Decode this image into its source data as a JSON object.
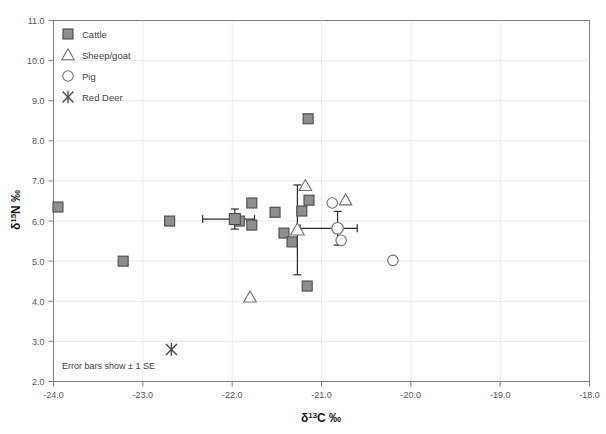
{
  "chart_data": {
    "type": "scatter",
    "title": "",
    "xlabel": "δ 13C ‰",
    "ylabel": "δ 15N ‰",
    "xlim": [
      -24.0,
      -18.0
    ],
    "ylim": [
      2.0,
      11.0
    ],
    "xticks": [
      "-24.0",
      "-23.0",
      "-22.0",
      "-21.0",
      "-20.0",
      "-19.0",
      "-18.0"
    ],
    "yticks": [
      "2.0",
      "3.0",
      "4.0",
      "5.0",
      "6.0",
      "7.0",
      "8.0",
      "9.0",
      "10.0",
      "11.0"
    ],
    "grid": true,
    "legend_position": "top-left",
    "annotation": "Error bars show ± 1 SE",
    "series": [
      {
        "name": "Cattle",
        "marker": "filled-square",
        "color": "#8e8e8e",
        "points": [
          {
            "x": -23.95,
            "y": 6.35
          },
          {
            "x": -23.22,
            "y": 5.0
          },
          {
            "x": -22.7,
            "y": 6.0
          },
          {
            "x": -21.92,
            "y": 6.0
          },
          {
            "x": -21.78,
            "y": 6.45
          },
          {
            "x": -21.78,
            "y": 5.9
          },
          {
            "x": -21.52,
            "y": 6.22
          },
          {
            "x": -21.42,
            "y": 5.7
          },
          {
            "x": -21.33,
            "y": 5.48
          },
          {
            "x": -21.22,
            "y": 6.25
          },
          {
            "x": -21.14,
            "y": 6.52
          },
          {
            "x": -21.15,
            "y": 8.55
          },
          {
            "x": -21.16,
            "y": 4.38
          }
        ]
      },
      {
        "name": "Sheep/goat",
        "marker": "open-triangle",
        "color": "#6e6e6e",
        "points": [
          {
            "x": -21.18,
            "y": 6.88
          },
          {
            "x": -20.73,
            "y": 6.52
          },
          {
            "x": -21.8,
            "y": 4.1
          }
        ]
      },
      {
        "name": "Pig",
        "marker": "open-circle",
        "color": "#6e6e6e",
        "points": [
          {
            "x": -20.88,
            "y": 6.45
          },
          {
            "x": -20.78,
            "y": 5.52
          },
          {
            "x": -20.2,
            "y": 5.02
          }
        ]
      },
      {
        "name": "Red Deer",
        "marker": "x-star",
        "color": "#4a4a4a",
        "points": [
          {
            "x": -22.68,
            "y": 2.8
          }
        ]
      }
    ],
    "means": [
      {
        "name": "Cattle mean",
        "marker": "filled-square",
        "x": -21.97,
        "y": 6.05,
        "xerr_low": 0.36,
        "xerr_high": 0.22,
        "yerr": 0.25
      },
      {
        "name": "Sheep/goat mean",
        "marker": "open-triangle",
        "x": -21.27,
        "y": 5.78,
        "xerr_low": 0.0,
        "xerr_high": 0.0,
        "yerr": 1.12
      },
      {
        "name": "Pig mean",
        "marker": "open-circle",
        "x": -20.82,
        "y": 5.82,
        "xerr_low": 0.42,
        "xerr_high": 0.22,
        "yerr": 0.42
      }
    ]
  },
  "legend": {
    "items": [
      {
        "label": "Cattle",
        "marker": "filled-square"
      },
      {
        "label": "Sheep/goat",
        "marker": "open-triangle"
      },
      {
        "label": "Pig",
        "marker": "open-circle"
      },
      {
        "label": "Red Deer",
        "marker": "x-star"
      }
    ]
  },
  "axis": {
    "x_title_main": "C ‰",
    "x_title_delta": "δ",
    "x_title_sup": "13",
    "y_title_main": "N ‰",
    "y_title_delta": "δ",
    "y_title_sup": "15"
  },
  "ticks": {
    "x": [
      "-24.0",
      "-23.0",
      "-22.0",
      "-21.0",
      "-20.0",
      "-19.0",
      "-18.0"
    ],
    "y": [
      "11.0",
      "10.0",
      "9.0",
      "8.0",
      "7.0",
      "6.0",
      "5.0",
      "4.0",
      "3.0",
      "2.0"
    ]
  },
  "note": {
    "text": "Error bars show ± 1 SE"
  }
}
